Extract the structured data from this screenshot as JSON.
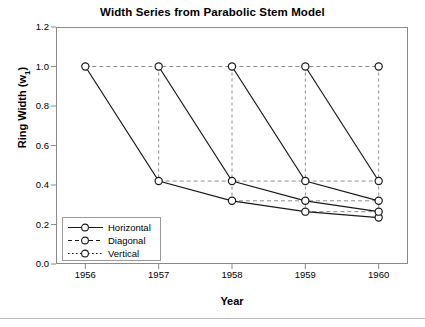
{
  "chart_data": {
    "type": "line",
    "title": "Width Series from Parabolic Stem Model",
    "xlabel": "Year",
    "ylabel": "Ring Width (w1)",
    "ylabel_base": "Ring Width (w",
    "ylabel_sub": "1",
    "ylabel_tail": ")",
    "x": [
      1956,
      1957,
      1958,
      1959,
      1960
    ],
    "xtick_labels": [
      "1956",
      "1957",
      "1958",
      "1959",
      "1960"
    ],
    "ytick_labels": [
      "0.0",
      "0.2",
      "0.4",
      "0.6",
      "0.8",
      "1.0",
      "1.2"
    ],
    "ytick_values": [
      0.0,
      0.2,
      0.4,
      0.6,
      0.8,
      1.0,
      1.2
    ],
    "xlim": [
      1955.6,
      1960.4
    ],
    "ylim": [
      0.0,
      1.2
    ],
    "grid": "dashed-connectors-between-markers",
    "legend_position": "bottom-left-inside",
    "legend": [
      "Horizontal",
      "Diagonal",
      "Vertical"
    ],
    "series": [
      {
        "name": "Horizontal",
        "style": "solid",
        "marker": "open-circle",
        "comment": "Cohort series each starting at 1.0 and declining",
        "cohorts": [
          {
            "start_year": 1956,
            "x": [
              1956,
              1957,
              1958,
              1959,
              1960
            ],
            "values": [
              1.0,
              0.42,
              0.32,
              0.265,
              0.235
            ]
          },
          {
            "start_year": 1957,
            "x": [
              1957,
              1958,
              1959,
              1960
            ],
            "values": [
              1.0,
              0.42,
              0.32,
              0.265
            ]
          },
          {
            "start_year": 1958,
            "x": [
              1958,
              1959,
              1960
            ],
            "values": [
              1.0,
              0.42,
              0.32
            ]
          },
          {
            "start_year": 1959,
            "x": [
              1959,
              1960
            ],
            "values": [
              1.0,
              0.42
            ]
          },
          {
            "start_year": 1960,
            "x": [
              1960
            ],
            "values": [
              1.0
            ]
          }
        ]
      },
      {
        "name": "Diagonal",
        "style": "dashed",
        "marker": "open-circle",
        "comment": "Horizontal dashed connectors joining equal-age values across years",
        "levels": [
          {
            "value": 1.0,
            "x": [
              1956,
              1957,
              1958,
              1959,
              1960
            ]
          },
          {
            "value": 0.42,
            "x": [
              1957,
              1958,
              1959,
              1960
            ]
          },
          {
            "value": 0.32,
            "x": [
              1958,
              1959,
              1960
            ]
          },
          {
            "value": 0.265,
            "x": [
              1959,
              1960
            ]
          },
          {
            "value": 0.235,
            "x": [
              1960
            ]
          }
        ]
      },
      {
        "name": "Vertical",
        "style": "dotted",
        "marker": "open-circle",
        "comment": "Vertical dotted connectors within each calendar year",
        "columns": [
          {
            "year": 1956,
            "values": [
              1.0
            ]
          },
          {
            "year": 1957,
            "values": [
              1.0,
              0.42
            ]
          },
          {
            "year": 1958,
            "values": [
              1.0,
              0.42,
              0.32
            ]
          },
          {
            "year": 1959,
            "values": [
              1.0,
              0.42,
              0.32,
              0.265
            ]
          },
          {
            "year": 1960,
            "values": [
              1.0,
              0.42,
              0.32,
              0.265,
              0.235
            ]
          }
        ]
      }
    ],
    "colors": {
      "line": "#1a1a1a",
      "connector": "#8c8c8c",
      "frame": "#8a8a8a",
      "marker_face": "#ffffff",
      "background": "#ffffff"
    }
  }
}
